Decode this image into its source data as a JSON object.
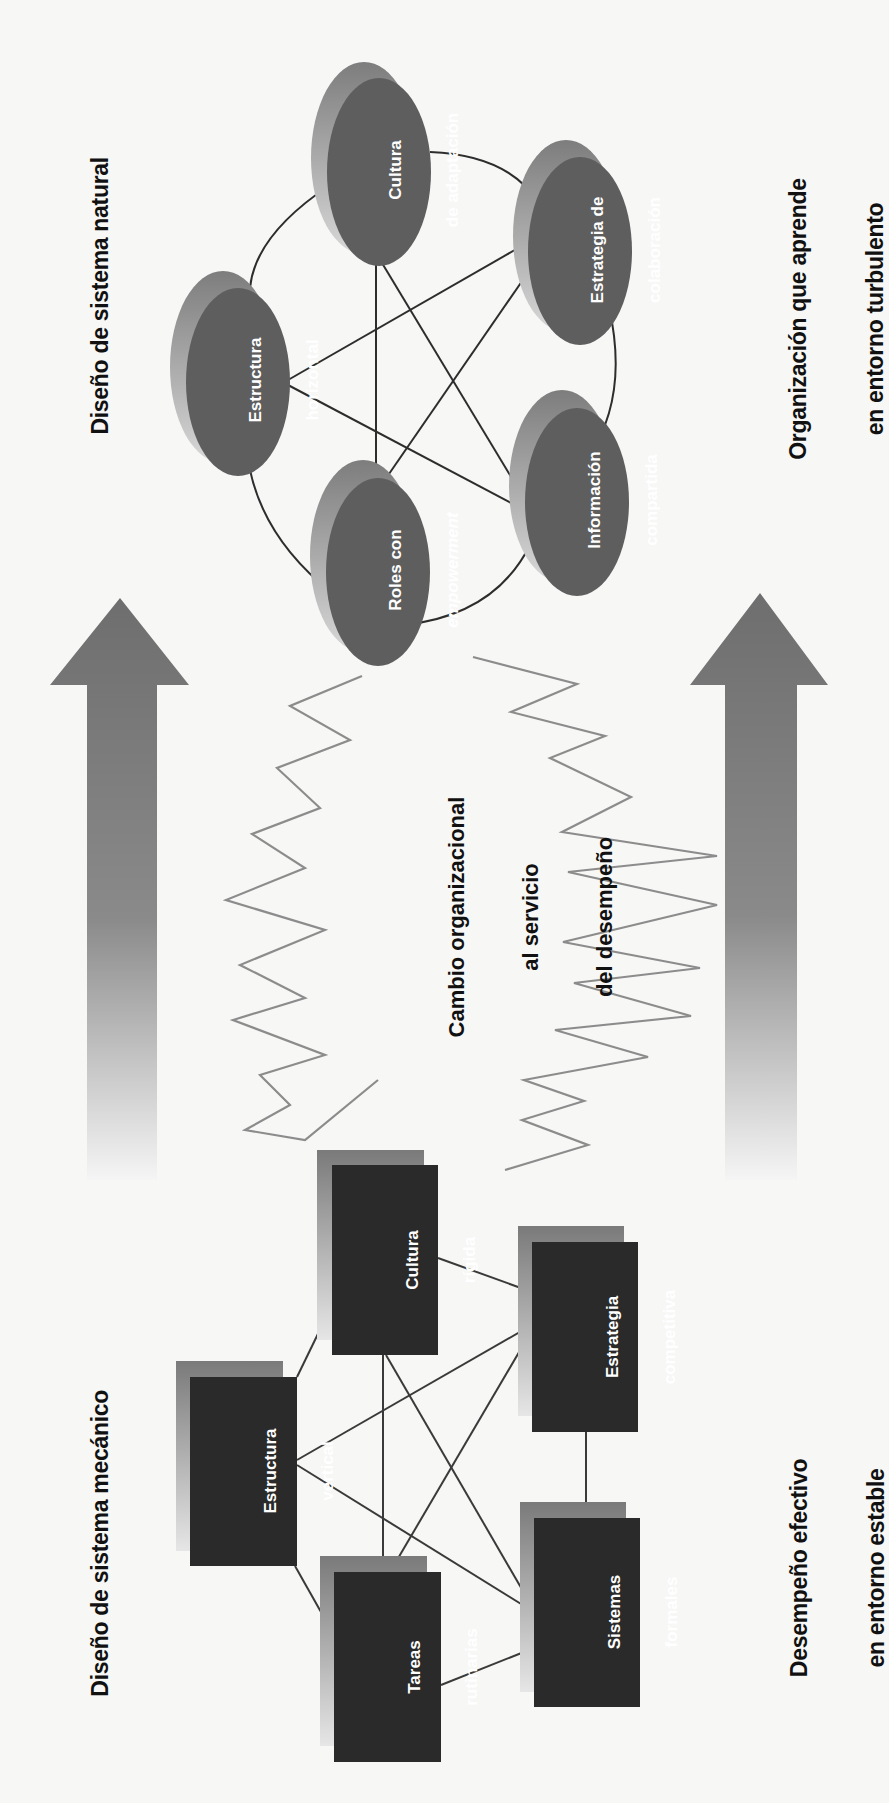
{
  "diagram": {
    "headings": {
      "top_left": "Diseño de sistema natural",
      "top_right": [
        "Organización que aprende",
        "en entorno turbulento"
      ],
      "bottom_left": "Diseño de sistema mecánico",
      "bottom_right": [
        "Desempeño efectivo",
        "en entorno estable"
      ],
      "center": [
        "Cambio organizacional",
        "al servicio",
        "del desempeño"
      ]
    },
    "natural_system_nodes": [
      {
        "id": "cultura-adaptacion",
        "lines": [
          "Cultura",
          "de adaptación"
        ]
      },
      {
        "id": "estrategia-colaboracion",
        "lines": [
          "Estrategia de",
          "colaboración"
        ]
      },
      {
        "id": "estructura-horizontal",
        "lines": [
          "Estructura",
          "horizontal"
        ]
      },
      {
        "id": "roles-empowerment",
        "lines": [
          "Roles con",
          "empowerment"
        ]
      },
      {
        "id": "informacion-compartida",
        "lines": [
          "Información",
          "compartida"
        ]
      }
    ],
    "mechanical_system_nodes": [
      {
        "id": "cultura-rigida",
        "lines": [
          "Cultura",
          "rígida"
        ]
      },
      {
        "id": "estrategia-competitiva",
        "lines": [
          "Estrategia",
          "competitiva"
        ]
      },
      {
        "id": "estructura-vertical",
        "lines": [
          "Estructura",
          "vertical"
        ]
      },
      {
        "id": "tareas-rutinarias",
        "lines": [
          "Tareas",
          "rutinarias"
        ]
      },
      {
        "id": "sistemas-formales",
        "lines": [
          "Sistemas",
          "formales"
        ]
      }
    ],
    "arrows": [
      {
        "id": "left-arrow",
        "direction": "up"
      },
      {
        "id": "right-arrow",
        "direction": "up"
      }
    ],
    "colors": {
      "ellipse_fill": "#5f5f5f",
      "ellipse_shadow": "#8a8a8a",
      "box_fill": "#2a2a2a",
      "box_shadow": "#7e7e7e",
      "arrow_fill": "#777777",
      "zigzag_stroke": "#8a8a8a",
      "connector_stroke": "#333333"
    }
  }
}
